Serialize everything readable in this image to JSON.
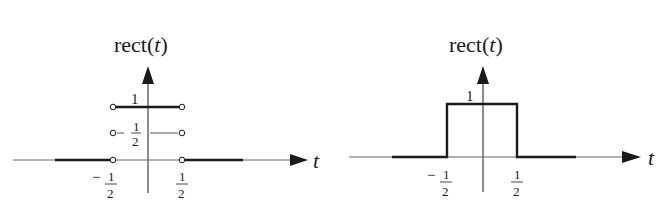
{
  "panels": [
    {
      "id": "left",
      "title_prefix": "rect(",
      "title_var": "t",
      "title_suffix": ")",
      "axis_label": "t",
      "ytick_one": "1",
      "ytick_half_num": "1",
      "ytick_half_den": "2",
      "ytick_half_minus": "−",
      "xtick_neg_sign": "−",
      "xtick_neg_num": "1",
      "xtick_neg_den": "2",
      "xtick_pos_num": "1",
      "xtick_pos_den": "2",
      "style": "open-circle endpoints with value 1/2 candidates at discontinuities"
    },
    {
      "id": "right",
      "title_prefix": "rect(",
      "title_var": "t",
      "title_suffix": ")",
      "axis_label": "t",
      "ytick_one": "1",
      "xtick_neg_sign": "−",
      "xtick_neg_num": "1",
      "xtick_neg_den": "2",
      "xtick_pos_num": "1",
      "xtick_pos_den": "2",
      "style": "rectangular pulse drawn with vertical edges"
    }
  ],
  "colors": {
    "ink": "#1a1a1a",
    "thin_axis": "#555555",
    "background": "#ffffff"
  }
}
